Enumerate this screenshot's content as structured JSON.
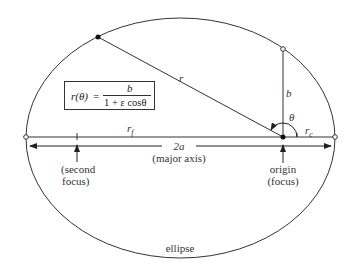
{
  "diagram": {
    "title": "ellipse",
    "formula": {
      "lhs": "r(θ)",
      "equals": "=",
      "numerator": "b",
      "denominator": "1 + ε cosθ"
    },
    "labels": {
      "r": "r",
      "b": "b",
      "theta": "θ",
      "r_c": "r",
      "r_c_sub": "c",
      "r_f": "r",
      "r_f_sub": "f",
      "two_a": "2a",
      "major_axis": "(major axis)",
      "second_focus_line1": "(second",
      "second_focus_line2": "focus)",
      "origin_line1": "origin",
      "origin_line2": "(focus)",
      "ellipse": "ellipse"
    },
    "colors": {
      "stroke": "#333333",
      "background": "#ffffff"
    }
  }
}
